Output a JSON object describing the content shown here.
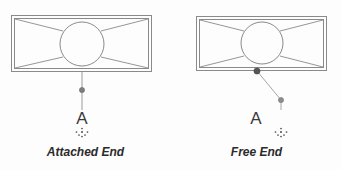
{
  "figure": {
    "background_color": "#fdfdfd",
    "line_color": "#8a8a8a",
    "node_color": "#7d7d7d",
    "dark_node_color": "#555555",
    "text_color": "#2b2b2b",
    "letter_color": "#3a3a3a"
  },
  "panels": [
    {
      "id": "attached-end",
      "caption": "Attached End",
      "section_letter": "A",
      "leader_type": "vertical",
      "rect": {
        "x": 11,
        "y": 15,
        "width": 141,
        "height": 57
      },
      "inner_inset": 3,
      "circle": {
        "cx": 82,
        "cy": 44,
        "r": 22
      },
      "leader_node": {
        "x": 82,
        "y": 90
      },
      "anchor": {
        "x": 82,
        "y": 72
      },
      "letter_pos": {
        "x": 82,
        "y": 120
      },
      "dot_cluster": {
        "cx": 82,
        "cy": 133
      }
    },
    {
      "id": "free-end",
      "caption": "Free End",
      "section_letter": "A",
      "leader_type": "diagonal",
      "rect": {
        "x": 196,
        "y": 16,
        "width": 131,
        "height": 55
      },
      "inner_inset": 3,
      "circle": {
        "cx": 262,
        "cy": 43,
        "r": 21
      },
      "leader_node": {
        "x": 281,
        "y": 100
      },
      "anchor": {
        "x": 256,
        "y": 71
      },
      "letter_pos": {
        "x": 281,
        "y": 120
      },
      "dot_cluster": {
        "cx": 281,
        "cy": 133
      }
    }
  ],
  "symbols": {
    "letter_name": "section-mark-letter",
    "dot_cluster_name": "datum-dot-cluster",
    "node_name": "leader-node"
  }
}
